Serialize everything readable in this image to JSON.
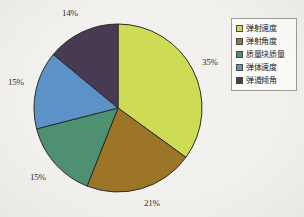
{
  "chart_data": {
    "type": "pie",
    "title": "",
    "categories": [
      "弹射速度",
      "弹射角度",
      "质量块质量",
      "弹体速度",
      "弹道倾角"
    ],
    "values": [
      35,
      21,
      15,
      15,
      14
    ],
    "value_labels": [
      "35%",
      "21%",
      "15%",
      "15%",
      "14%"
    ],
    "colors": [
      "#cedc55",
      "#9c7526",
      "#4e9070",
      "#5b93c8",
      "#473a52"
    ],
    "units": "percent",
    "start_angle_deg": 0,
    "direction": "clockwise",
    "legend_position": "right",
    "grid": false,
    "xlabel": "",
    "ylabel": ""
  },
  "legend": {
    "items": [
      {
        "label": "弹射速度",
        "color": "#cedc55"
      },
      {
        "label": "弹射角度",
        "color": "#9c7526"
      },
      {
        "label": "质量块质量",
        "color": "#4e9070"
      },
      {
        "label": "弹体速度",
        "color": "#5b93c8"
      },
      {
        "label": "弹道倾角",
        "color": "#473a52"
      }
    ]
  },
  "labels": {
    "top": "14%",
    "right": "35%",
    "bottom": "21%",
    "lower_left": "15%",
    "upper_left": "15%"
  },
  "style": {
    "background": "#f2f1ee",
    "slice_outline": "#2b2b2b",
    "legend_border": "#9b9b9b"
  }
}
